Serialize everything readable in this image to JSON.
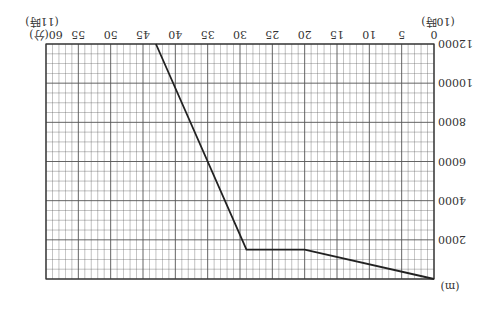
{
  "chart_data": {
    "type": "line",
    "orientation_note": "image rendered rotated 180 degrees",
    "title": "",
    "xlabel": "(分)",
    "x_start_label": "(10時)",
    "x_end_label": "(11時)",
    "ylabel": "(m)",
    "xlim": [
      0,
      60
    ],
    "ylim": [
      0,
      12000
    ],
    "x_ticks": [
      0,
      5,
      10,
      15,
      20,
      25,
      30,
      35,
      40,
      45,
      50,
      55,
      60
    ],
    "y_ticks": [
      0,
      2000,
      4000,
      6000,
      8000,
      10000,
      12000
    ],
    "grid": true,
    "series": [
      {
        "name": "altitude",
        "x": [
          0,
          20,
          29,
          43
        ],
        "y": [
          0,
          1500,
          1500,
          12000
        ]
      }
    ],
    "colors": {
      "line": "#222222",
      "grid": "#555555"
    }
  }
}
